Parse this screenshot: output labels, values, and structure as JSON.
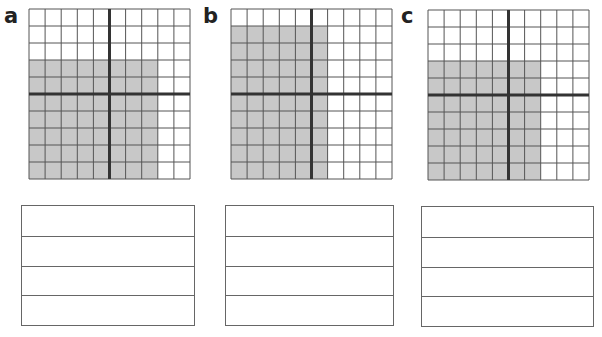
{
  "panels": [
    {
      "label": "a",
      "grid": {
        "rows": 10,
        "cols": 10,
        "shaded_rows_from_top": [
          4,
          10
        ],
        "shaded_cols_from_left": [
          1,
          8
        ],
        "shaded_count": 56
      },
      "answer_lines": 4
    },
    {
      "label": "b",
      "grid": {
        "rows": 10,
        "cols": 10,
        "shaded_rows_from_top": [
          2,
          10
        ],
        "shaded_cols_from_left": [
          1,
          6
        ],
        "shaded_count": 54
      },
      "answer_lines": 4
    },
    {
      "label": "c",
      "grid": {
        "rows": 10,
        "cols": 10,
        "shaded_rows_from_top": [
          4,
          10
        ],
        "shaded_cols_from_left": [
          1,
          7
        ],
        "shaded_count": 49
      },
      "answer_lines": 4
    }
  ],
  "colors": {
    "shade": "#c8c8c8",
    "grid_line": "#555555",
    "axis_line": "#333333",
    "box_line": "#666666"
  }
}
